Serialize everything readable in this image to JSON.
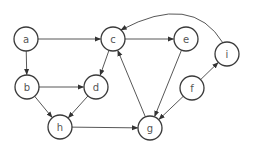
{
  "graph": {
    "type": "directed",
    "nodes": [
      {
        "id": "a",
        "label": "a",
        "x": 26,
        "y": 39
      },
      {
        "id": "c",
        "label": "c",
        "x": 113,
        "y": 39
      },
      {
        "id": "e",
        "label": "e",
        "x": 186,
        "y": 39
      },
      {
        "id": "i",
        "label": "i",
        "x": 227,
        "y": 54
      },
      {
        "id": "b",
        "label": "b",
        "x": 27,
        "y": 87
      },
      {
        "id": "d",
        "label": "d",
        "x": 96,
        "y": 87
      },
      {
        "id": "f",
        "label": "f",
        "x": 192,
        "y": 88
      },
      {
        "id": "h",
        "label": "h",
        "x": 60,
        "y": 127
      },
      {
        "id": "g",
        "label": "g",
        "x": 150,
        "y": 128
      }
    ],
    "edges": [
      {
        "from": "a",
        "to": "c"
      },
      {
        "from": "a",
        "to": "b"
      },
      {
        "from": "c",
        "to": "e"
      },
      {
        "from": "c",
        "to": "d"
      },
      {
        "from": "b",
        "to": "d"
      },
      {
        "from": "b",
        "to": "h"
      },
      {
        "from": "d",
        "to": "h"
      },
      {
        "from": "h",
        "to": "g"
      },
      {
        "from": "e",
        "to": "g"
      },
      {
        "from": "g",
        "to": "c"
      },
      {
        "from": "f",
        "to": "g"
      },
      {
        "from": "f",
        "to": "i"
      },
      {
        "from": "i",
        "to": "c",
        "curved": true
      }
    ]
  },
  "colors": {
    "stroke": "#3a3a3a",
    "label": "#555555",
    "background": "#ffffff"
  }
}
